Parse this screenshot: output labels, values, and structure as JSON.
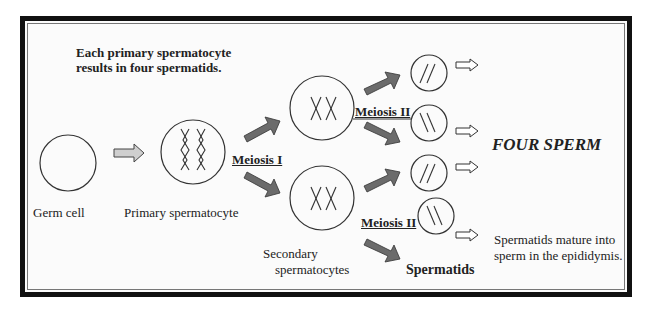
{
  "diagram": {
    "title_line1": "Each primary spermatocyte",
    "title_line2": "results in four spermatids.",
    "labels": {
      "germ_cell": "Germ cell",
      "primary_spermatocyte": "Primary spermatocyte",
      "meiosis_1": "Meiosis I",
      "meiosis_2_top": "Meiosis II",
      "meiosis_2_bottom": "Meiosis II",
      "secondary_line1": "Secondary",
      "secondary_line2": "spermatocytes",
      "spermatids": "Spermatids",
      "four_sperm": "FOUR SPERM",
      "mature_line1": "Spermatids mature into",
      "mature_line2": "sperm in the epididymis."
    },
    "colors": {
      "border": "#111111",
      "thick_arrow": "#6b6b6b",
      "light_arrow": "#cfcfcf",
      "outline": "#333333"
    }
  }
}
